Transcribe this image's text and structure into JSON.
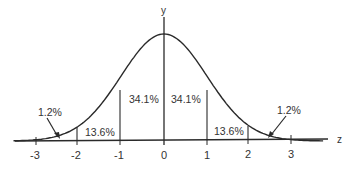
{
  "chart_data": {
    "type": "line",
    "title": "",
    "subtitle": "",
    "xlabel": "z",
    "ylabel": "y",
    "xlim": [
      -3.5,
      3.7
    ],
    "x_ticks": [
      -3,
      -2,
      -1,
      0,
      1,
      2,
      3
    ],
    "x_tick_labels": [
      "-3",
      "-2",
      "-1",
      "0",
      "1",
      "2",
      "3"
    ],
    "grid": false,
    "legend": null,
    "series": [
      {
        "name": "standard normal curve",
        "function": "y = (1/sqrt(2*pi)) * exp(-z^2/2)"
      }
    ],
    "regions": [
      {
        "from": -3,
        "to": -2,
        "label": "1.2%",
        "value": 1.2,
        "annotation": "arrow"
      },
      {
        "from": -2,
        "to": -1,
        "label": "13.6%",
        "value": 13.6
      },
      {
        "from": -1,
        "to": 0,
        "label": "34.1%",
        "value": 34.1
      },
      {
        "from": 0,
        "to": 1,
        "label": "34.1%",
        "value": 34.1
      },
      {
        "from": 1,
        "to": 2,
        "label": "13.6%",
        "value": 13.6
      },
      {
        "from": 2,
        "to": 3,
        "label": "1.2%",
        "value": 1.2,
        "annotation": "arrow"
      }
    ]
  },
  "labels": {
    "y_axis": "y",
    "z_axis": "z",
    "region_left_tail": "1.2%",
    "region_left_mid": "13.6%",
    "region_left_center": "34.1%",
    "region_right_center": "34.1%",
    "region_right_mid": "13.6%",
    "region_right_tail": "1.2%",
    "tick_m3": "-3",
    "tick_m2": "-2",
    "tick_m1": "-1",
    "tick_0": "0",
    "tick_p1": "1",
    "tick_p2": "2",
    "tick_p3": "3"
  },
  "colors": {
    "line": "#2a2a2a",
    "text": "#333333",
    "background": "#ffffff"
  }
}
